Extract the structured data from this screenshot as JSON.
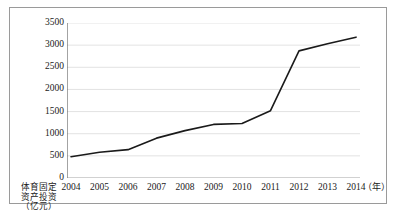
{
  "chart_data": {
    "type": "line",
    "title": "",
    "subtitle": "",
    "xlabel": "（年）",
    "ylabel": "体育固定资产投资（亿元）",
    "ylabel_lines": [
      "体育固定",
      "资产投资",
      "（亿元）"
    ],
    "x_unit": "（年）",
    "categories": [
      "2004",
      "2005",
      "2006",
      "2007",
      "2008",
      "2009",
      "2010",
      "2011",
      "2012",
      "2013",
      "2014"
    ],
    "values": [
      480,
      580,
      640,
      900,
      1070,
      1210,
      1230,
      1520,
      2870,
      3030,
      3180
    ],
    "series": [
      {
        "name": "体育固定资产投资",
        "values": [
          480,
          580,
          640,
          900,
          1070,
          1210,
          1230,
          1520,
          2870,
          3030,
          3180
        ],
        "color": "#1a1a1a"
      }
    ],
    "ylim": [
      0,
      3500
    ],
    "yticks": [
      0,
      500,
      1000,
      1500,
      2000,
      2500,
      3000,
      3500
    ],
    "ytick_labels": [
      "0",
      "500",
      "1000",
      "1500",
      "2000",
      "2500",
      "3000",
      "3500"
    ],
    "xtick_labels": [
      "2004",
      "2005",
      "2006",
      "2007",
      "2008",
      "2009",
      "2010",
      "2011",
      "2012",
      "2013",
      "2014"
    ],
    "grid": true,
    "grid_axis": "y",
    "grid_color": "#d6d6d6",
    "legend": false,
    "legend_position": "none",
    "line_color": "#1a1a1a",
    "line_width": 1.6,
    "markers": false,
    "axis_color": "#8c8c8c",
    "border_color": "#9a9a9a",
    "background": "#ffffff"
  }
}
